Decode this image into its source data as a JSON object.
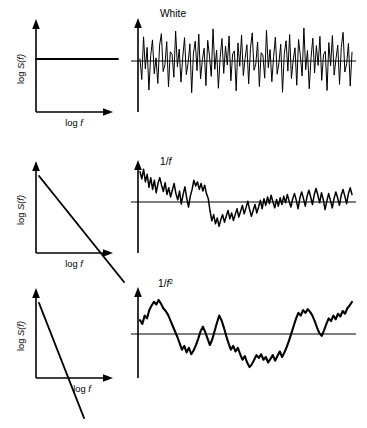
{
  "figure": {
    "background_color": "#ffffff",
    "line_color": "#000000",
    "rows": [
      {
        "id": "white",
        "signal_label": "White",
        "spectrum": {
          "ylabel_prefix": "log ",
          "ylabel_italic": "S(f)",
          "xlabel_prefix": "log ",
          "xlabel_italic": "f",
          "slope_description": "flat",
          "exponent": 0
        }
      },
      {
        "id": "pink",
        "signal_label": "1/f",
        "signal_label_prefix": "1/",
        "signal_label_italic": "f",
        "signal_label_sup": "",
        "spectrum": {
          "ylabel_prefix": "log ",
          "ylabel_italic": "S(f)",
          "xlabel_prefix": "log ",
          "xlabel_italic": "f",
          "slope_description": "slope -1",
          "exponent": 1
        }
      },
      {
        "id": "brown",
        "signal_label": "1/f2",
        "signal_label_prefix": "1/",
        "signal_label_italic": "f",
        "signal_label_sup": "2",
        "spectrum": {
          "ylabel_prefix": "log ",
          "ylabel_italic": "S(f)",
          "xlabel_prefix": "log ",
          "xlabel_italic": "f",
          "slope_description": "slope -2",
          "exponent": 2
        }
      }
    ]
  },
  "chart_data": [
    {
      "type": "line",
      "id": "spectrum-white",
      "title": "",
      "xlabel": "log f",
      "ylabel": "log S(f)",
      "grid": false,
      "legend": "none",
      "xlim": [
        0,
        1
      ],
      "ylim": [
        0,
        1
      ],
      "series": [
        {
          "name": "white spectrum",
          "x": [
            0.0,
            1.0
          ],
          "values": [
            0.62,
            0.62
          ]
        }
      ],
      "annotation": "Flat spectrum, exponent 0"
    },
    {
      "type": "line",
      "id": "signal-white",
      "title": "White",
      "xlabel": "",
      "ylabel": "",
      "grid": false,
      "legend": "none",
      "xlim": [
        0,
        1
      ],
      "ylim": [
        -1,
        1
      ],
      "series": [
        {
          "name": "white noise",
          "values": [
            0.05,
            -0.42,
            0.55,
            -0.18,
            0.31,
            -0.66,
            0.12,
            0.48,
            -0.29,
            0.07,
            -0.51,
            0.36,
            0.62,
            -0.24,
            -0.08,
            0.44,
            -0.59,
            0.21,
            0.15,
            -0.37,
            0.68,
            -0.13,
            0.27,
            -0.48,
            0.09,
            0.53,
            -0.31,
            -0.05,
            0.39,
            -0.72,
            0.18,
            0.45,
            -0.22,
            0.61,
            -0.41,
            0.03,
            0.29,
            -0.56,
            0.47,
            0.11,
            -0.35,
            0.73,
            -0.19,
            0.25,
            -0.62,
            0.08,
            0.51,
            -0.28,
            0.34,
            -0.09,
            0.57,
            -0.45,
            0.16,
            0.23,
            -0.68,
            0.41,
            -0.12,
            0.59,
            -0.33,
            0.06,
            0.37,
            -0.52,
            0.28,
            0.64,
            -0.21,
            -0.07,
            0.43,
            -0.58,
            0.19,
            0.13,
            -0.39,
            0.7,
            -0.15,
            0.26,
            -0.47,
            0.1,
            0.54,
            -0.3,
            -0.04,
            0.38,
            -0.71,
            0.17,
            0.46,
            -0.23,
            0.6,
            -0.4,
            0.02,
            0.3,
            -0.55,
            0.49,
            0.12,
            -0.34,
            0.75,
            -0.2,
            0.24,
            -0.63,
            0.07,
            0.52,
            -0.27,
            0.35,
            -0.1,
            0.56,
            -0.44,
            0.14,
            0.22,
            -0.67,
            0.42,
            -0.11,
            0.58,
            -0.32,
            0.05,
            0.36,
            -0.53,
            0.31,
            0.65,
            -0.25,
            -0.06,
            0.4,
            -0.57,
            0.2
          ]
        }
      ],
      "annotation": "Uncorrelated white noise, equal power at all frequencies"
    },
    {
      "type": "line",
      "id": "spectrum-pink",
      "title": "",
      "xlabel": "log f",
      "ylabel": "log S(f)",
      "grid": false,
      "legend": "none",
      "xlim": [
        0,
        1
      ],
      "ylim": [
        0,
        1
      ],
      "series": [
        {
          "name": "pink spectrum",
          "x": [
            0.0,
            1.0
          ],
          "values": [
            0.88,
            -0.18
          ]
        }
      ],
      "annotation": "Slope -1 on log-log axes"
    },
    {
      "type": "line",
      "id": "signal-pink",
      "title": "1/f",
      "xlabel": "",
      "ylabel": "",
      "grid": false,
      "legend": "none",
      "xlim": [
        0,
        1
      ],
      "ylim": [
        -1,
        1
      ],
      "series": [
        {
          "name": "pink noise",
          "values": [
            0.72,
            0.55,
            0.78,
            0.48,
            0.66,
            0.35,
            0.58,
            0.3,
            0.52,
            0.22,
            0.44,
            0.58,
            0.4,
            0.25,
            0.46,
            0.18,
            0.34,
            0.12,
            0.28,
            0.44,
            0.2,
            0.05,
            0.26,
            -0.05,
            0.18,
            0.36,
            0.1,
            -0.12,
            0.14,
            0.3,
            0.52,
            0.38,
            0.48,
            0.3,
            0.44,
            0.26,
            0.4,
            0.2,
            0.08,
            -0.22,
            -0.45,
            -0.3,
            -0.52,
            -0.38,
            -0.58,
            -0.42,
            -0.3,
            -0.48,
            -0.34,
            -0.2,
            -0.4,
            -0.26,
            -0.44,
            -0.3,
            -0.16,
            -0.36,
            -0.22,
            -0.08,
            -0.28,
            -0.14,
            0.02,
            -0.18,
            -0.34,
            -0.2,
            -0.06,
            -0.26,
            -0.12,
            0.04,
            -0.16,
            0.08,
            -0.08,
            0.12,
            -0.04,
            0.16,
            0.0,
            -0.14,
            0.06,
            -0.1,
            0.1,
            -0.06,
            0.14,
            -0.02,
            0.18,
            0.02,
            -0.12,
            0.08,
            0.2,
            0.04,
            -0.16,
            0.1,
            0.24,
            0.08,
            -0.1,
            0.14,
            0.28,
            0.12,
            -0.06,
            0.18,
            0.32,
            0.16,
            -0.02,
            0.22,
            0.06,
            -0.18,
            0.02,
            0.2,
            0.04,
            -0.14,
            0.08,
            0.24,
            0.1,
            -0.08,
            0.16,
            0.3,
            0.14,
            -0.04,
            0.2,
            0.34,
            0.18
          ]
        }
      ],
      "annotation": "Pink noise, 1/f spectrum"
    },
    {
      "type": "line",
      "id": "spectrum-brown",
      "title": "",
      "xlabel": "log f",
      "ylabel": "log S(f)",
      "grid": false,
      "legend": "none",
      "xlim": [
        0,
        1
      ],
      "ylim": [
        0,
        1
      ],
      "series": [
        {
          "name": "brown spectrum",
          "x": [
            0.0,
            1.0
          ],
          "values": [
            0.9,
            -0.7
          ]
        }
      ],
      "annotation": "Slope -2 on log-log axes"
    },
    {
      "type": "line",
      "id": "signal-brown",
      "title": "1/f2",
      "xlabel": "",
      "ylabel": "",
      "grid": false,
      "legend": "none",
      "xlim": [
        0,
        1
      ],
      "ylim": [
        -1,
        1
      ],
      "series": [
        {
          "name": "brown noise",
          "values": [
            0.3,
            0.22,
            0.4,
            0.34,
            0.52,
            0.62,
            0.7,
            0.64,
            0.74,
            0.66,
            0.56,
            0.5,
            0.42,
            0.3,
            0.18,
            0.06,
            -0.06,
            -0.2,
            -0.34,
            -0.26,
            -0.4,
            -0.3,
            -0.44,
            -0.36,
            -0.24,
            -0.1,
            0.06,
            0.16,
            0.04,
            -0.1,
            -0.24,
            -0.12,
            0.06,
            0.24,
            0.4,
            0.3,
            0.14,
            -0.04,
            -0.2,
            -0.34,
            -0.26,
            -0.38,
            -0.3,
            -0.44,
            -0.56,
            -0.48,
            -0.62,
            -0.72,
            -0.66,
            -0.56,
            -0.46,
            -0.52,
            -0.44,
            -0.56,
            -0.5,
            -0.62,
            -0.54,
            -0.46,
            -0.58,
            -0.48,
            -0.38,
            -0.5,
            -0.4,
            -0.28,
            -0.14,
            0.02,
            0.18,
            0.34,
            0.46,
            0.4,
            0.52,
            0.46,
            0.54,
            0.48,
            0.4,
            0.28,
            0.14,
            0.02,
            -0.04,
            0.08,
            0.22,
            0.34,
            0.28,
            0.4,
            0.32,
            0.44,
            0.38,
            0.5,
            0.44,
            0.56,
            0.62,
            0.7
          ]
        }
      ],
      "annotation": "Brownian / red noise, 1/f^2 spectrum"
    }
  ]
}
